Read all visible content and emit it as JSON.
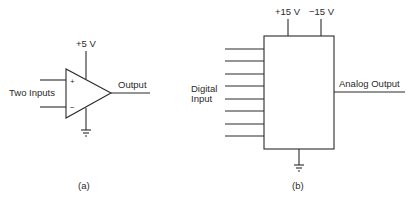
{
  "diagram_a": {
    "caption": "(a)",
    "supply_label": "+5 V",
    "inputs_label": "Two Inputs",
    "plus_sign": "+",
    "minus_sign": "−",
    "output_label": "Output",
    "component": "op-amp"
  },
  "diagram_b": {
    "caption": "(b)",
    "supply_positive_label": "+15 V",
    "supply_negative_label": "−15 V",
    "input_label_line1": "Digital",
    "input_label_line2": "Input",
    "output_label": "Analog Output",
    "input_line_count": 8,
    "component": "digital-to-analog converter"
  }
}
